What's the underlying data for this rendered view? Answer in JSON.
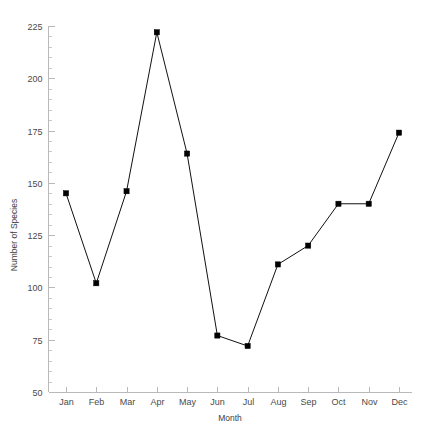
{
  "chart_data": {
    "type": "line",
    "title": "",
    "subtitle": "",
    "xlabel": "Month",
    "ylabel": "Number of Species",
    "categories": [
      "Jan",
      "Feb",
      "Mar",
      "Apr",
      "May",
      "Jun",
      "Jul",
      "Aug",
      "Sep",
      "Oct",
      "Nov",
      "Dec"
    ],
    "values": [
      145,
      102,
      146,
      222,
      164,
      77,
      72,
      111,
      120,
      140,
      140,
      174
    ],
    "series": [
      {
        "name": "Number of Species",
        "values": [
          145,
          102,
          146,
          222,
          164,
          77,
          72,
          111,
          120,
          140,
          140,
          174
        ]
      }
    ],
    "ylim": [
      50,
      225
    ],
    "y_ticks": [
      50,
      75,
      100,
      125,
      150,
      175,
      200,
      225
    ],
    "y_tick_labels": [
      "50",
      "75",
      "100",
      "125",
      "150",
      "175",
      "200",
      "225"
    ],
    "y_minor_interval": 5,
    "x_tick_labels": [
      "Jan",
      "Feb",
      "Mar",
      "Apr",
      "May",
      "Jun",
      "Jul",
      "Aug",
      "Sep",
      "Oct",
      "Nov",
      "Dec"
    ],
    "grid": false,
    "legend": false,
    "legend_position": "none",
    "marker": "square",
    "line_color": "#111111",
    "marker_color": "#000000",
    "axis_color": "#b9b9b9",
    "background_color": "#ffffff",
    "annotations": []
  }
}
